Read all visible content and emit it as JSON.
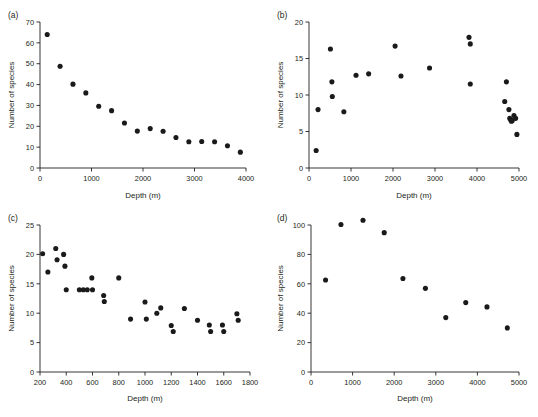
{
  "figure": {
    "background": "#ffffff",
    "point_color": "#1a1a1a",
    "axis_color": "#231f20"
  },
  "panels": [
    {
      "id": "a",
      "label": "(a)"
    },
    {
      "id": "b",
      "label": "(b)"
    },
    {
      "id": "c",
      "label": "(c)"
    },
    {
      "id": "d",
      "label": "(d)"
    }
  ],
  "chart_data": [
    {
      "type": "scatter",
      "panel": "(a)",
      "title": "",
      "xlabel": "Depth (m)",
      "ylabel": "Number of species",
      "xlim": [
        0,
        4000
      ],
      "ylim": [
        0,
        70
      ],
      "xticks": [
        0,
        1000,
        2000,
        3000,
        4000
      ],
      "yticks": [
        0,
        10,
        20,
        30,
        40,
        50,
        60,
        70
      ],
      "grid": false,
      "legend": "none",
      "x": [
        140,
        390,
        640,
        890,
        1140,
        1390,
        1640,
        1890,
        2140,
        2390,
        2640,
        2890,
        3140,
        3390,
        3640,
        3890
      ],
      "y": [
        64,
        48.8,
        40.2,
        36,
        29.6,
        27.5,
        21.6,
        17.7,
        18.9,
        17.6,
        14.6,
        12.6,
        12.7,
        12.6,
        10.7,
        7.6
      ]
    },
    {
      "type": "scatter",
      "panel": "(b)",
      "title": "",
      "xlabel": "Depth (m)",
      "ylabel": "Number of species",
      "xlim": [
        0,
        5000
      ],
      "ylim": [
        0,
        20
      ],
      "xticks": [
        0,
        1000,
        2000,
        3000,
        4000,
        5000
      ],
      "yticks": [
        0,
        5,
        10,
        15,
        20
      ],
      "grid": false,
      "legend": "none",
      "x": [
        170,
        215,
        510,
        545,
        555,
        830,
        1120,
        1420,
        2050,
        2190,
        2870,
        3810,
        3840,
        3840,
        4660,
        4700,
        4760,
        4780,
        4800,
        4820,
        4840,
        4880,
        4920,
        4950
      ],
      "y": [
        2.4,
        8.0,
        16.3,
        11.8,
        9.8,
        7.7,
        12.7,
        12.9,
        16.7,
        12.6,
        13.7,
        17.9,
        17.0,
        11.5,
        9.1,
        11.8,
        8.0,
        6.8,
        6.6,
        6.4,
        6.5,
        7.2,
        6.8,
        4.6
      ]
    },
    {
      "type": "scatter",
      "panel": "(c)",
      "title": "",
      "xlabel": "Depth (m)",
      "ylabel": "Number of species",
      "xlim": [
        200,
        1800
      ],
      "ylim": [
        0,
        25
      ],
      "xticks": [
        200,
        400,
        600,
        800,
        1000,
        1200,
        1400,
        1600,
        1800
      ],
      "yticks": [
        0,
        5,
        10,
        15,
        20,
        25
      ],
      "grid": false,
      "legend": "none",
      "x": [
        220,
        260,
        320,
        330,
        380,
        390,
        400,
        500,
        530,
        560,
        595,
        600,
        685,
        690,
        800,
        890,
        1000,
        1010,
        1090,
        1120,
        1200,
        1215,
        1300,
        1400,
        1490,
        1500,
        1590,
        1600,
        1700,
        1710
      ],
      "y": [
        20.1,
        17.0,
        21.0,
        19.1,
        20.0,
        18.0,
        14.0,
        14.0,
        14.0,
        14.0,
        16.0,
        14.0,
        13.0,
        12.0,
        16.0,
        9.0,
        11.9,
        9.0,
        10.0,
        10.9,
        7.9,
        6.9,
        10.8,
        8.8,
        8.0,
        6.9,
        8.0,
        6.9,
        9.9,
        8.8
      ]
    },
    {
      "type": "scatter",
      "panel": "(d)",
      "title": "",
      "xlabel": "Depth (m)",
      "ylabel": "Number of species",
      "xlim": [
        0,
        5000
      ],
      "ylim": [
        0,
        100
      ],
      "xticks": [
        0,
        1000,
        2000,
        3000,
        4000,
        5000
      ],
      "yticks": [
        0,
        20,
        40,
        60,
        80,
        100
      ],
      "grid": false,
      "legend": "none",
      "x": [
        350,
        720,
        1250,
        1760,
        2210,
        2750,
        3240,
        3720,
        4230,
        4720
      ],
      "y": [
        62.6,
        100.3,
        103.2,
        94.8,
        63.6,
        56.9,
        37.0,
        47.2,
        44.3,
        30.0
      ]
    }
  ]
}
